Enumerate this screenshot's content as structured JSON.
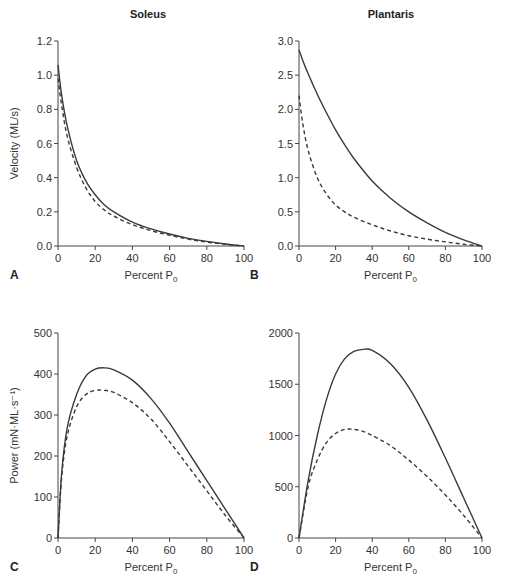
{
  "figure": {
    "column_titles": [
      "Soleus",
      "Plantaris"
    ]
  },
  "chart_data": [
    {
      "type": "line",
      "panel": "A",
      "title": "Soleus",
      "xlabel": "Percent P0",
      "ylabel": "Velocity (ML/s)",
      "xlim": [
        0,
        100
      ],
      "ylim": [
        0,
        1.2
      ],
      "xticks": [
        0,
        20,
        40,
        60,
        80,
        100
      ],
      "yticks": [
        "0.0",
        "0.2",
        "0.4",
        "0.6",
        "0.8",
        "1.0",
        "1.2"
      ],
      "grid": false,
      "x": [
        0,
        2,
        5,
        10,
        15,
        20,
        25,
        30,
        40,
        50,
        60,
        70,
        80,
        90,
        100
      ],
      "series": [
        {
          "name": "solid",
          "style": "solid",
          "values": [
            1.06,
            0.88,
            0.7,
            0.5,
            0.38,
            0.3,
            0.24,
            0.2,
            0.14,
            0.1,
            0.07,
            0.045,
            0.027,
            0.012,
            0.0
          ]
        },
        {
          "name": "dashed",
          "style": "dashed",
          "values": [
            0.98,
            0.82,
            0.64,
            0.46,
            0.34,
            0.26,
            0.21,
            0.175,
            0.125,
            0.09,
            0.063,
            0.04,
            0.023,
            0.01,
            0.0
          ]
        }
      ]
    },
    {
      "type": "line",
      "panel": "B",
      "title": "Plantaris",
      "xlabel": "Percent P0",
      "ylabel": "",
      "xlim": [
        0,
        100
      ],
      "ylim": [
        0,
        3.0
      ],
      "xticks": [
        0,
        20,
        40,
        60,
        80,
        100
      ],
      "yticks": [
        "0.0",
        "0.5",
        "1.0",
        "1.5",
        "2.0",
        "2.5",
        "3.0"
      ],
      "grid": false,
      "x": [
        0,
        2,
        5,
        10,
        15,
        20,
        25,
        30,
        40,
        50,
        60,
        70,
        80,
        90,
        100
      ],
      "series": [
        {
          "name": "solid",
          "style": "solid",
          "values": [
            2.87,
            2.72,
            2.52,
            2.22,
            1.95,
            1.7,
            1.48,
            1.28,
            0.95,
            0.7,
            0.5,
            0.34,
            0.2,
            0.09,
            0.0
          ]
        },
        {
          "name": "dashed",
          "style": "dashed",
          "values": [
            2.2,
            1.8,
            1.4,
            1.0,
            0.76,
            0.6,
            0.5,
            0.42,
            0.31,
            0.22,
            0.15,
            0.1,
            0.06,
            0.025,
            0.0
          ]
        }
      ]
    },
    {
      "type": "line",
      "panel": "C",
      "title": "",
      "xlabel": "Percent P0",
      "ylabel": "Power (mN·ML·s⁻¹)",
      "xlim": [
        0,
        100
      ],
      "ylim": [
        0,
        500
      ],
      "xticks": [
        0,
        20,
        40,
        60,
        80,
        100
      ],
      "yticks": [
        "0",
        "100",
        "200",
        "300",
        "400",
        "500"
      ],
      "grid": false,
      "x": [
        0,
        2,
        5,
        10,
        15,
        20,
        25,
        30,
        40,
        50,
        60,
        70,
        80,
        90,
        100
      ],
      "series": [
        {
          "name": "solid",
          "style": "solid",
          "values": [
            0,
            160,
            270,
            350,
            395,
            412,
            415,
            410,
            385,
            340,
            280,
            210,
            140,
            70,
            0
          ]
        },
        {
          "name": "dashed",
          "style": "dashed",
          "values": [
            0,
            150,
            250,
            320,
            350,
            360,
            360,
            355,
            330,
            290,
            235,
            175,
            115,
            55,
            0
          ]
        }
      ]
    },
    {
      "type": "line",
      "panel": "D",
      "title": "",
      "xlabel": "Percent P0",
      "ylabel": "",
      "xlim": [
        0,
        100
      ],
      "ylim": [
        0,
        2000
      ],
      "xticks": [
        0,
        20,
        40,
        60,
        80,
        100
      ],
      "yticks": [
        "0",
        "500",
        "1000",
        "1500",
        "2000"
      ],
      "grid": false,
      "x": [
        0,
        5,
        10,
        15,
        20,
        25,
        30,
        35,
        40,
        50,
        60,
        70,
        80,
        90,
        100
      ],
      "series": [
        {
          "name": "solid",
          "style": "solid",
          "values": [
            0,
            560,
            1000,
            1350,
            1600,
            1750,
            1820,
            1840,
            1830,
            1700,
            1470,
            1150,
            780,
            390,
            0
          ]
        },
        {
          "name": "dashed",
          "style": "dashed",
          "values": [
            0,
            500,
            760,
            930,
            1020,
            1060,
            1060,
            1040,
            1000,
            900,
            760,
            600,
            420,
            220,
            0
          ]
        }
      ]
    }
  ],
  "panels": [
    {
      "letter": "A",
      "xlabel": "Percent P",
      "xlabel_sub": "0"
    },
    {
      "letter": "B",
      "xlabel": "Percent P",
      "xlabel_sub": "0"
    },
    {
      "letter": "C",
      "xlabel": "Percent P",
      "xlabel_sub": "0"
    },
    {
      "letter": "D",
      "xlabel": "Percent P",
      "xlabel_sub": "0"
    }
  ],
  "colors": {
    "line": "#3a3a3a",
    "axis": "#444444"
  }
}
